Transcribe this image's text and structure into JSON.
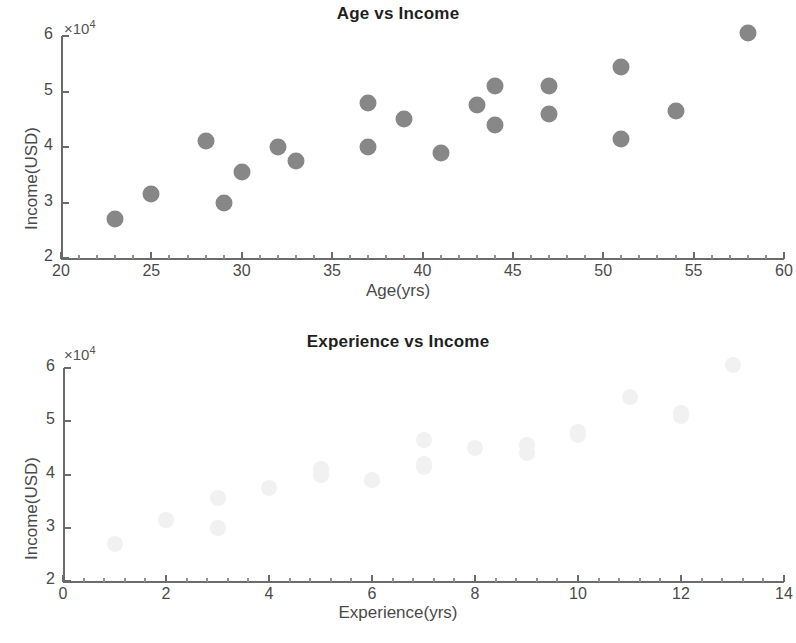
{
  "figures": [
    {
      "id": "age-vs-income",
      "title": "Age vs Income",
      "xlabel": "Age(yrs)",
      "ylabel": "Income(USD)",
      "multiplier": "×10",
      "multiplier_exp": "4",
      "xticks": [
        "20",
        "25",
        "30",
        "35",
        "40",
        "45",
        "50",
        "55",
        "60"
      ],
      "yticks": [
        "6",
        "5",
        "4",
        "3",
        "2"
      ]
    },
    {
      "id": "experience-vs-income",
      "title": "Experience vs Income",
      "xlabel": "Experience(yrs)",
      "ylabel": "Income(USD)",
      "multiplier": "×10",
      "multiplier_exp": "4",
      "xticks": [
        "0",
        "2",
        "4",
        "6",
        "8",
        "10",
        "12",
        "14"
      ],
      "yticks": [
        "6",
        "5",
        "4",
        "3",
        "2"
      ]
    }
  ],
  "colors": {
    "marker_age": "#878787",
    "marker_experience": "#f1f1f1",
    "axis": "#6b6b6b",
    "text": "#4a4a4a",
    "title": "#1f1f1f",
    "background": "#ffffff"
  },
  "chart_data": [
    {
      "type": "scatter",
      "title": "Age vs Income",
      "xlabel": "Age(yrs)",
      "ylabel": "Income(USD)",
      "y_multiplier": 10000,
      "xlim": [
        20,
        60
      ],
      "ylim": [
        20000,
        60000
      ],
      "xticks": [
        20,
        25,
        30,
        35,
        40,
        45,
        50,
        55,
        60
      ],
      "yticks": [
        20000,
        30000,
        40000,
        50000,
        60000
      ],
      "grid": false,
      "legend": "none",
      "marker_color": "#878787",
      "x": [
        23,
        25,
        28,
        29,
        30,
        32,
        33,
        37,
        37,
        39,
        41,
        43,
        44,
        44,
        47,
        47,
        51,
        51,
        54,
        58
      ],
      "y": [
        27000,
        31500,
        41000,
        30000,
        35500,
        40000,
        37500,
        48000,
        40000,
        45000,
        39000,
        47500,
        51000,
        44000,
        51000,
        46000,
        54500,
        41500,
        46500,
        60500
      ]
    },
    {
      "type": "scatter",
      "title": "Experience vs Income",
      "xlabel": "Experience(yrs)",
      "ylabel": "Income(USD)",
      "y_multiplier": 10000,
      "xlim": [
        0,
        14
      ],
      "ylim": [
        20000,
        60000
      ],
      "xticks": [
        0,
        2,
        4,
        6,
        8,
        10,
        12,
        14
      ],
      "yticks": [
        20000,
        30000,
        40000,
        50000,
        60000
      ],
      "grid": false,
      "legend": "none",
      "marker_color": "#f1f1f1",
      "x": [
        1,
        2,
        3,
        3,
        4,
        5,
        5,
        6,
        7,
        7,
        7,
        8,
        9,
        9,
        10,
        10,
        11,
        12,
        12,
        13
      ],
      "y": [
        27000,
        31500,
        35500,
        30000,
        37500,
        41000,
        40000,
        39000,
        46500,
        42000,
        41500,
        45000,
        45500,
        44000,
        48000,
        47500,
        54500,
        51500,
        51000,
        60500
      ]
    }
  ]
}
